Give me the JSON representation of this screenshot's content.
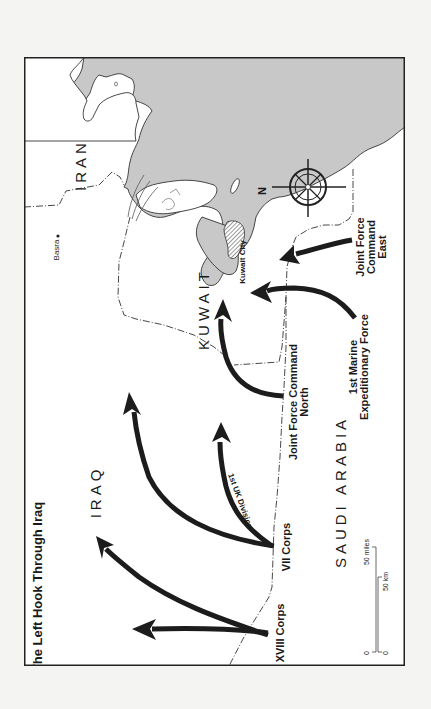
{
  "map": {
    "title": "The Left Hook Through Iraq",
    "orientation": "rotated 90 degrees counterclockwise (north points left)",
    "colors": {
      "page_background": "#f4f4f2",
      "land": "#ffffff",
      "water": "#c8c8c8",
      "ink": "#1c1c1c",
      "kuwait_city_hatch": "#555555"
    },
    "countries": [
      {
        "id": "iran",
        "label": "IRAN"
      },
      {
        "id": "iraq",
        "label": "IRAQ"
      },
      {
        "id": "kuwait",
        "label": "KUWAIT"
      },
      {
        "id": "saudi-arabia",
        "label": "SAUDI ARABIA"
      }
    ],
    "cities": [
      {
        "id": "basra",
        "label": "Basra"
      },
      {
        "id": "kuwait-city",
        "label": "Kuwait City"
      }
    ],
    "forces": [
      {
        "id": "xviii-corps",
        "label": "XVIII Corps"
      },
      {
        "id": "vii-corps",
        "label": "VII Corps"
      },
      {
        "id": "1st-uk-division",
        "label": "1st UK Division"
      },
      {
        "id": "jfc-north",
        "line1": "Joint Force Command",
        "line2": "North"
      },
      {
        "id": "1st-mef",
        "line1": "1st Marine",
        "line2": "Expeditionary Force"
      },
      {
        "id": "jfc-east",
        "line1": "Joint Force",
        "line2": "Command",
        "line3": "East"
      }
    ],
    "compass": {
      "north_label": "N"
    },
    "scale_bar": {
      "miles_zero": "0",
      "miles_label": "50 miles",
      "km_zero": "0",
      "km_label": "50 km"
    }
  }
}
